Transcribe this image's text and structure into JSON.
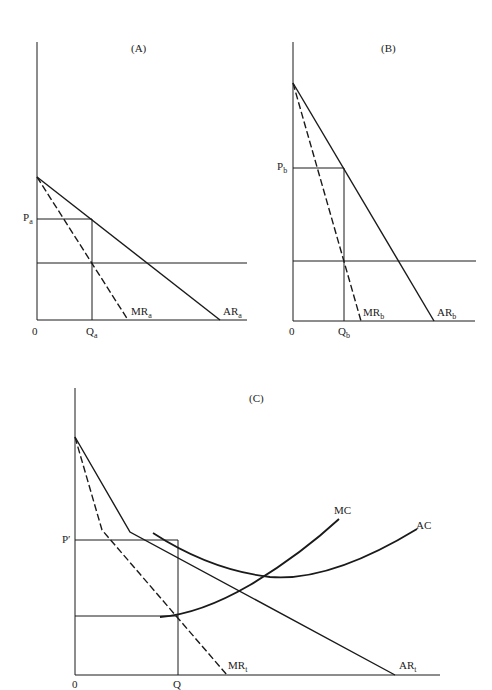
{
  "panels": {
    "A": {
      "title": "(A)",
      "origin": "0",
      "price_label": "P",
      "price_sub": "a",
      "qty_label": "Q",
      "qty_sub": "a",
      "mr_label": "MR",
      "mr_sub": "a",
      "ar_label": "AR",
      "ar_sub": "a"
    },
    "B": {
      "title": "(B)",
      "origin": "0",
      "price_label": "P",
      "price_sub": "b",
      "qty_label": "Q",
      "qty_sub": "b",
      "mr_label": "MR",
      "mr_sub": "b",
      "ar_label": "AR",
      "ar_sub": "b"
    },
    "C": {
      "title": "(C)",
      "origin": "0",
      "price_label": "P′",
      "qty_label": "Q",
      "mr_label": "MR",
      "mr_sub": "t",
      "ar_label": "AR",
      "ar_sub": "t",
      "mc_label": "MC",
      "ac_label": "AC"
    }
  },
  "colors": {
    "line": "#1a1a1a",
    "background": "#ffffff"
  }
}
